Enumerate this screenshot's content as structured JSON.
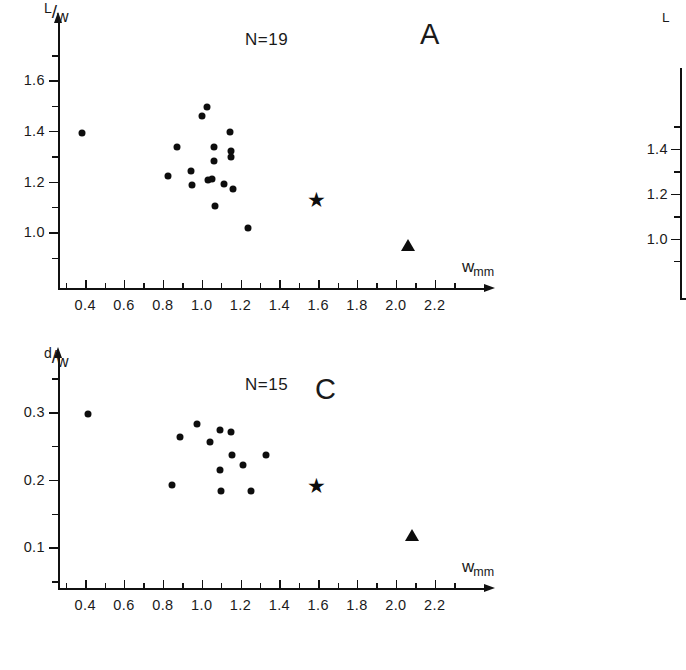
{
  "figure": {
    "background": "#ffffff",
    "ink_color": "#0d0d0d"
  },
  "panels": [
    {
      "id": "A",
      "letter": "A",
      "n_label": "N=19",
      "y_title_numerator": "L",
      "y_title_bar": "/",
      "y_title_denominator": "w",
      "x_title_main": "w",
      "x_title_sub": "mm"
    },
    {
      "id": "C",
      "letter": "C",
      "n_label": "N=15",
      "y_title_numerator": "d",
      "y_title_bar": "/",
      "y_title_denominator": "w",
      "x_title_main": "w",
      "x_title_sub": "mm"
    },
    {
      "id": "B",
      "letter": "",
      "n_label": "",
      "y_title_numerator": "L",
      "y_title_bar": "",
      "y_title_denominator": "",
      "x_title_main": "",
      "x_title_sub": ""
    }
  ],
  "chart_data": [
    {
      "id": "A",
      "type": "scatter",
      "title": "A",
      "annotation": "N=19",
      "xlabel": "w mm",
      "ylabel": "L/w",
      "xlim": [
        0.26,
        2.32
      ],
      "ylim": [
        0.78,
        1.76
      ],
      "grid": false,
      "legend": "none",
      "xticks": [
        0.4,
        0.6,
        0.8,
        1.0,
        1.2,
        1.4,
        1.6,
        1.8,
        2.0,
        2.2
      ],
      "xticklabels": [
        "0.4",
        "0.6",
        "0.8",
        "1.0",
        "1.2",
        "1.4",
        "1.6",
        "1.8",
        "2.0",
        "2.2"
      ],
      "xminorticks": [
        0.3,
        0.5,
        0.7,
        0.9,
        1.1,
        1.3,
        1.5,
        1.7,
        1.9,
        2.1,
        2.3
      ],
      "yticks": [
        1.0,
        1.2,
        1.4,
        1.6
      ],
      "yticklabels": [
        "1.0",
        "1.2",
        "1.4",
        "1.6"
      ],
      "yminorticks": [
        0.9,
        1.1,
        1.3,
        1.5,
        1.7
      ],
      "series": [
        {
          "name": "samples",
          "marker": "circle",
          "points": [
            [
              0.385,
              1.392
            ],
            [
              0.825,
              1.222
            ],
            [
              0.875,
              1.337
            ],
            [
              0.945,
              1.241
            ],
            [
              0.95,
              1.188
            ],
            [
              1.0,
              1.459
            ],
            [
              1.025,
              1.497
            ],
            [
              1.03,
              1.205
            ],
            [
              1.055,
              1.212
            ],
            [
              1.065,
              1.338
            ],
            [
              1.065,
              1.283
            ],
            [
              1.07,
              1.104
            ],
            [
              1.115,
              1.192
            ],
            [
              1.145,
              1.398
            ],
            [
              1.15,
              1.298
            ],
            [
              1.152,
              1.322
            ],
            [
              1.16,
              1.172
            ],
            [
              1.238,
              1.018
            ]
          ]
        },
        {
          "name": "star-specimen",
          "marker": "star",
          "points": [
            [
              1.592,
              1.133
            ]
          ]
        },
        {
          "name": "triangle-specimen",
          "marker": "triangle",
          "points": [
            [
              2.062,
              0.948
            ]
          ]
        }
      ]
    },
    {
      "id": "C",
      "type": "scatter",
      "title": "C",
      "annotation": "N=15",
      "xlabel": "w mm",
      "ylabel": "d/w",
      "xlim": [
        0.26,
        2.32
      ],
      "ylim": [
        0.04,
        0.355
      ],
      "grid": false,
      "legend": "none",
      "xticks": [
        0.4,
        0.6,
        0.8,
        1.0,
        1.2,
        1.4,
        1.6,
        1.8,
        2.0,
        2.2
      ],
      "xticklabels": [
        "0.4",
        "0.6",
        "0.8",
        "1.0",
        "1.2",
        "1.4",
        "1.6",
        "1.8",
        "2.0",
        "2.2"
      ],
      "xminorticks": [
        0.3,
        0.5,
        0.7,
        0.9,
        1.1,
        1.3,
        1.5,
        1.7,
        1.9,
        2.1,
        2.3
      ],
      "yticks": [
        0.1,
        0.2,
        0.3
      ],
      "yticklabels": [
        "0.1",
        "0.2",
        "0.3"
      ],
      "yminorticks": [
        0.05,
        0.15,
        0.25,
        0.35
      ],
      "series": [
        {
          "name": "samples",
          "marker": "circle",
          "points": [
            [
              0.412,
              0.298
            ],
            [
              0.848,
              0.192
            ],
            [
              0.89,
              0.264
            ],
            [
              0.975,
              0.282
            ],
            [
              1.042,
              0.256
            ],
            [
              1.092,
              0.274
            ],
            [
              1.095,
              0.215
            ],
            [
              1.098,
              0.184
            ],
            [
              1.152,
              0.271
            ],
            [
              1.158,
              0.236
            ],
            [
              1.212,
              0.222
            ],
            [
              1.252,
              0.183
            ],
            [
              1.33,
              0.237
            ]
          ]
        },
        {
          "name": "star-specimen",
          "marker": "star",
          "points": [
            [
              1.592,
              0.193
            ]
          ]
        },
        {
          "name": "triangle-specimen",
          "marker": "triangle",
          "points": [
            [
              2.082,
              0.118
            ]
          ]
        }
      ]
    },
    {
      "id": "B",
      "type": "scatter",
      "title": "",
      "annotation": "",
      "xlabel": "",
      "ylabel": "L",
      "xlim": [
        0,
        1
      ],
      "ylim": [
        0.78,
        1.76
      ],
      "grid": false,
      "legend": "none",
      "xticks": [],
      "xticklabels": [],
      "xminorticks": [],
      "yticks": [
        1.0,
        1.2,
        1.4
      ],
      "yticklabels": [
        "1.0",
        "1.2",
        "1.4"
      ],
      "yminorticks": [
        0.9,
        1.1,
        1.3,
        1.5
      ],
      "series": []
    }
  ]
}
